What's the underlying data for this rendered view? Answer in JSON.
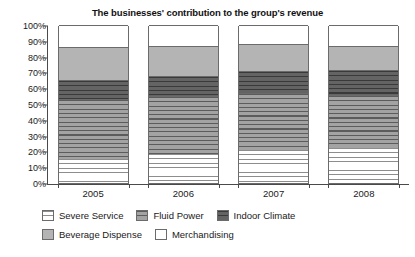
{
  "chart_data": {
    "type": "bar",
    "subtype": "stacked-bar-100-percent",
    "title": "The businesses' contribution to the group's revenue",
    "xlabel": "",
    "ylabel": "",
    "categories": [
      "2005",
      "2006",
      "2007",
      "2008"
    ],
    "ylim": [
      0,
      100
    ],
    "ytick_labels": [
      "0%",
      "10%",
      "20%",
      "30%",
      "40%",
      "50%",
      "60%",
      "70%",
      "80%",
      "90%",
      "100%"
    ],
    "ytick_values": [
      0,
      10,
      20,
      30,
      40,
      50,
      60,
      70,
      80,
      90,
      100
    ],
    "grid": false,
    "legend_position": "bottom-left",
    "series": [
      {
        "name": "Severe Service",
        "values": [
          15,
          18.5,
          21,
          22
        ],
        "fill": "white-horizontal-hatch",
        "color": "#ffffff"
      },
      {
        "name": "Fluid Power",
        "values": [
          38,
          36.5,
          36,
          34
        ],
        "fill": "gray-horizontal-stripe",
        "color": "#9a9a9a"
      },
      {
        "name": "Indoor Climate",
        "values": [
          12,
          13,
          14,
          15.5
        ],
        "fill": "dark-gray-horizontal-stripe",
        "color": "#5e5e5e"
      },
      {
        "name": "Beverage Dispense",
        "values": [
          21,
          19,
          17,
          15.5
        ],
        "fill": "solid-light-gray",
        "color": "#b4b4b4"
      },
      {
        "name": "Merchandising",
        "values": [
          14,
          13,
          12,
          13
        ],
        "fill": "solid-white",
        "color": "#ffffff"
      }
    ],
    "cumulative_tops": {
      "2005": [
        15,
        53,
        65,
        86,
        100
      ],
      "2006": [
        18.5,
        55,
        68,
        87,
        100
      ],
      "2007": [
        21,
        57,
        71,
        88,
        100
      ],
      "2008": [
        22,
        56,
        71.5,
        87,
        100
      ]
    }
  },
  "legend": {
    "rows": [
      [
        {
          "label": "Severe Service",
          "swatch": "p-severe"
        },
        {
          "label": "Fluid Power",
          "swatch": "p-fluid"
        },
        {
          "label": "Indoor Climate",
          "swatch": "p-indoor"
        }
      ],
      [
        {
          "label": "Beverage Dispense",
          "swatch": "p-beverage"
        },
        {
          "label": "Merchandising",
          "swatch": "p-merch"
        }
      ]
    ]
  }
}
